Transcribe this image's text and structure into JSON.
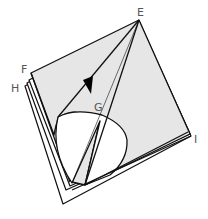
{
  "figure": {
    "colors": {
      "paper_fill": "#e6e6e6",
      "stroke": "#111111",
      "label": "#555555",
      "background": "#ffffff"
    },
    "labels": {
      "E": "E",
      "F": "F",
      "G": "G",
      "H": "H",
      "I": "I"
    },
    "arrow": "direction-arrow"
  }
}
